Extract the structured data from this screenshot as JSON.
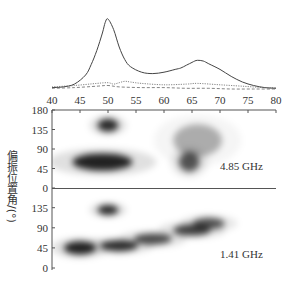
{
  "chart_data": {
    "type": "heatmap",
    "title": "",
    "xlabel": "",
    "ylabel": "偏振位置角/(°)",
    "x_ticks": [
      40,
      45,
      50,
      55,
      60,
      65,
      70,
      75,
      80
    ],
    "xlim": [
      40,
      80
    ],
    "profile_panel": {
      "type": "line",
      "series": [
        {
          "name": "total intensity",
          "style": "solid",
          "x": [
            40,
            42,
            44,
            46,
            47,
            48,
            49,
            49.5,
            50,
            51,
            52,
            53,
            54,
            56,
            58,
            60,
            62,
            63,
            64,
            65,
            65.5,
            66,
            67,
            68,
            70,
            72,
            74,
            76,
            78,
            80
          ],
          "y": [
            0.02,
            0.03,
            0.07,
            0.2,
            0.35,
            0.55,
            0.8,
            0.95,
            1.0,
            0.85,
            0.6,
            0.42,
            0.32,
            0.24,
            0.22,
            0.24,
            0.28,
            0.3,
            0.34,
            0.38,
            0.4,
            0.41,
            0.4,
            0.36,
            0.28,
            0.18,
            0.1,
            0.05,
            0.02,
            0.01
          ]
        },
        {
          "name": "linear polarization",
          "style": "dotted",
          "x": [
            40,
            44,
            48,
            50,
            51,
            52,
            53,
            54,
            56,
            60,
            64,
            66,
            70,
            74,
            78,
            80
          ],
          "y": [
            0.03,
            0.05,
            0.08,
            0.09,
            0.07,
            0.09,
            0.11,
            0.1,
            0.08,
            0.06,
            0.07,
            0.08,
            0.06,
            0.04,
            0.02,
            0.02
          ]
        },
        {
          "name": "circular polarization",
          "style": "dashed",
          "x": [
            40,
            44,
            48,
            50,
            52,
            56,
            60,
            64,
            68,
            72,
            76,
            80
          ],
          "y": [
            0.01,
            0.02,
            0.04,
            0.05,
            0.03,
            0.02,
            0.02,
            0.01,
            0.01,
            0.0,
            0.0,
            0.0
          ]
        }
      ]
    },
    "pa_panels": [
      {
        "label": "4.85 GHz",
        "ylim": [
          0,
          180
        ],
        "y_ticks": [
          0,
          45,
          90,
          135,
          180
        ],
        "blobs": [
          {
            "x": 50,
            "y": 145,
            "width": 3,
            "height": 25,
            "intensity": 0.95
          },
          {
            "x": 49,
            "y": 60,
            "width": 10,
            "height": 35,
            "intensity": 1.0
          },
          {
            "x": 64.5,
            "y": 60,
            "width": 3,
            "height": 40,
            "intensity": 0.75
          },
          {
            "x": 66,
            "y": 110,
            "width": 8,
            "height": 70,
            "intensity": 0.35
          }
        ]
      },
      {
        "label": "1.41 GHz",
        "ylim": [
          0,
          150
        ],
        "y_ticks": [
          0,
          45,
          90,
          135
        ],
        "blobs": [
          {
            "x": 50,
            "y": 130,
            "width": 3,
            "height": 18,
            "intensity": 0.95
          },
          {
            "x": 45,
            "y": 45,
            "width": 5,
            "height": 25,
            "intensity": 1.0
          },
          {
            "x": 52,
            "y": 50,
            "width": 6,
            "height": 20,
            "intensity": 0.95
          },
          {
            "x": 58,
            "y": 65,
            "width": 6,
            "height": 20,
            "intensity": 0.8
          },
          {
            "x": 65,
            "y": 85,
            "width": 6,
            "height": 20,
            "intensity": 0.85
          },
          {
            "x": 68,
            "y": 100,
            "width": 5,
            "height": 20,
            "intensity": 0.75
          }
        ]
      }
    ],
    "grid": false,
    "legend": null
  },
  "axes": {
    "x_tick_labels": [
      "40",
      "45",
      "50",
      "55",
      "60",
      "65",
      "70",
      "75",
      "80"
    ],
    "upper_y_tick_labels": [
      "180",
      "135",
      "90",
      "45",
      "0"
    ],
    "lower_y_tick_labels": [
      "135",
      "90",
      "45",
      "0"
    ],
    "ylabel": "偏振位置角/(°)"
  },
  "labels": {
    "upper_freq": "4.85 GHz",
    "lower_freq": "1.41 GHz"
  }
}
